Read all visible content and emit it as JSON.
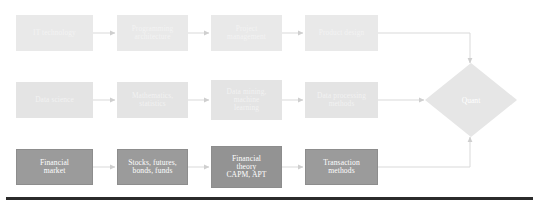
{
  "diagram": {
    "background_color": "#ffffff",
    "connector_color": "#d5d5d5",
    "rows": [
      {
        "id": "it-track",
        "name": "IT technology track",
        "tier": "light",
        "nodes": [
          {
            "id": "it-technology",
            "label": "IT technology"
          },
          {
            "id": "programming-architecture",
            "label": "Programming\narchitecture"
          },
          {
            "id": "project-management",
            "label": "Project\nmanagement"
          },
          {
            "id": "product-design",
            "label": "Product design"
          }
        ]
      },
      {
        "id": "data-track",
        "name": "Data science track",
        "tier": "mid",
        "nodes": [
          {
            "id": "data-science",
            "label": "Data science"
          },
          {
            "id": "mathematics-statistics",
            "label": "Mathematics,\nstatistics"
          },
          {
            "id": "data-mining-machine-learning",
            "label": "Data mining,\nmachine\nlearning"
          },
          {
            "id": "data-processing-methods",
            "label": "Data processing\nmethods"
          }
        ]
      },
      {
        "id": "finance-track",
        "name": "Finance track",
        "tier": "dark",
        "nodes": [
          {
            "id": "financial-market",
            "label": "Financial\nmarket"
          },
          {
            "id": "stocks-futures-bonds-funds",
            "label": "Stocks, futures,\nbonds, funds"
          },
          {
            "id": "financial-theory-capm-apt",
            "label": "Financial\ntheory\nCAPM, APT",
            "emphasis": true
          },
          {
            "id": "transaction-methods",
            "label": "Transaction\nmethods"
          }
        ]
      }
    ],
    "terminal": {
      "id": "quant",
      "label": "Quant",
      "shape": "diamond",
      "fill": "#e6e6e6"
    },
    "bottom_rule": {
      "color": "#2b2b2b"
    }
  }
}
